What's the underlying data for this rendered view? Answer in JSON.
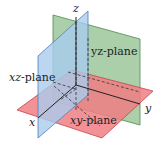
{
  "diagram": {
    "axes": {
      "x": "x",
      "y": "y",
      "z": "z"
    },
    "planes": [
      {
        "id": "yz",
        "var": "yz",
        "suffix": "-plane",
        "color": "#9cc79a"
      },
      {
        "id": "xz",
        "var": "xz",
        "suffix": "-plane",
        "color": "#a9ccee"
      },
      {
        "id": "xy",
        "var": "xy",
        "suffix": "-plane",
        "color": "#f07e84"
      }
    ]
  }
}
